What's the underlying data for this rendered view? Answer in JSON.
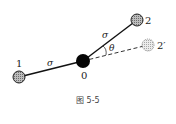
{
  "diagram": {
    "caption": "图 5-5",
    "nodes": {
      "n0": {
        "label": "0",
        "x": 83,
        "y": 61,
        "r": 7,
        "style": "solid-black"
      },
      "n1": {
        "label": "1",
        "x": 19,
        "y": 77,
        "r": 6,
        "style": "hatched"
      },
      "n2": {
        "label": "2",
        "x": 137,
        "y": 20,
        "r": 6,
        "style": "hatched"
      },
      "n2p": {
        "label": "2′",
        "x": 148,
        "y": 45,
        "r": 6,
        "style": "dotted"
      }
    },
    "bonds": [
      {
        "from": "n1",
        "to": "n0",
        "label": "σ",
        "style": "solid"
      },
      {
        "from": "n0",
        "to": "n2",
        "label": "σ",
        "style": "solid"
      },
      {
        "from": "n0",
        "to": "n2p",
        "label": "",
        "style": "dashed"
      }
    ],
    "angle_label": "θ"
  }
}
